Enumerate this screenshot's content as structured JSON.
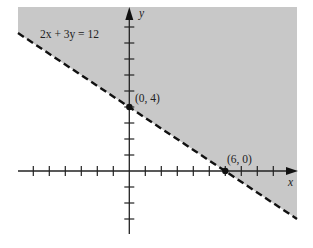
{
  "chart_data": {
    "type": "line",
    "title": "",
    "xlabel": "x",
    "ylabel": "y",
    "grid": false,
    "xlim": [
      -7,
      10.5
    ],
    "ylim": [
      -4,
      10
    ],
    "x_ticks": [
      -6,
      -5,
      -4,
      -3,
      -2,
      -1,
      1,
      2,
      3,
      4,
      5,
      6,
      7,
      8,
      9
    ],
    "y_ticks": [
      -3,
      -2,
      -1,
      1,
      2,
      3,
      4,
      5,
      6,
      7,
      8,
      9
    ],
    "series": [
      {
        "name": "2x + 3y = 12",
        "style": "dashed",
        "x": [
          -7,
          10.5
        ],
        "y": [
          8.667,
          -3
        ]
      }
    ],
    "shaded_region": {
      "inequality": "2x + 3y >= 12",
      "side": "above-right of line",
      "color": "#c8c8c8"
    },
    "points": [
      {
        "label": "(0, 4)",
        "x": 0,
        "y": 4
      },
      {
        "label": "(6, 0)",
        "x": 6,
        "y": 0
      }
    ],
    "annotations": [
      {
        "text": "2x + 3y = 12",
        "position": "upper-left"
      }
    ]
  },
  "labels": {
    "equation": "2x + 3y = 12",
    "point_a": "(0, 4)",
    "point_b": "(6, 0)",
    "x_axis": "x",
    "y_axis": "y"
  }
}
